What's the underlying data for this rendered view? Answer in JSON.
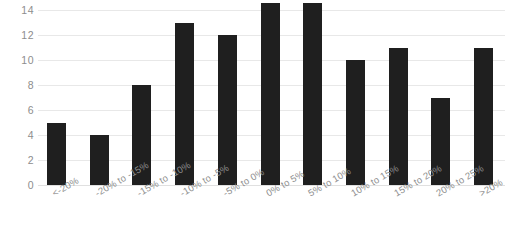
{
  "chart_data": {
    "type": "bar",
    "title": "",
    "xlabel": "",
    "ylabel": "",
    "categories": [
      "<-20%",
      "-20% to -15%",
      "-15% to -10%",
      "-10% to -5%",
      "-5% to 0%",
      "0% to 5%",
      "5% to 10%",
      "10% to 15%",
      "15% to 20%",
      "20% to 25%",
      ">20%"
    ],
    "values": [
      5,
      4,
      8,
      13,
      12,
      14.6,
      14.6,
      10,
      11,
      7,
      11
    ],
    "ylim": [
      0,
      14.8
    ],
    "yticks": [
      0,
      2,
      4,
      6,
      8,
      10,
      12,
      14
    ],
    "ytick_labels": [
      "0",
      "2",
      "4",
      "6",
      "8",
      "10",
      "12",
      "14"
    ],
    "grid": true,
    "legend": "none",
    "bar_color": "#1f1f1f",
    "gridline_color": "#e8e8e8",
    "tick_label_color": "#8d8d8d",
    "background": "#ffffff",
    "x_label_rotation": -30,
    "clipped_top_text": ""
  }
}
